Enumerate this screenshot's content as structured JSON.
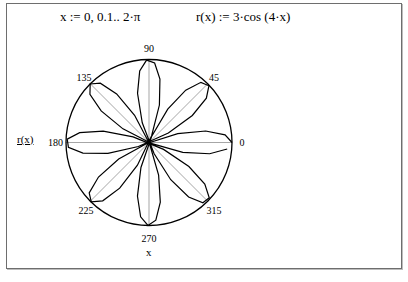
{
  "worksheet": {
    "range_definition": "x := 0, 0.1.. 2·π",
    "function_definition": "r(x) := 3·cos (4·x)"
  },
  "chart_data": {
    "type": "polar",
    "title": "",
    "radial_label": "r(x)",
    "angle_label": "x",
    "function": "r(x) = 3*cos(4*x)",
    "x_range": {
      "start": 0,
      "step": 0.1,
      "end": 6.283
    },
    "r_max": 3,
    "angle_ticks_deg": [
      "0",
      "45",
      "90",
      "135",
      "180",
      "225",
      "270",
      "315"
    ],
    "grid": {
      "radial_lines_every_deg": 45,
      "outer_circle": true
    },
    "petals": 8
  },
  "colors": {
    "curve": "#000000",
    "grid": "#808080",
    "frame": "#6e6e6e"
  }
}
